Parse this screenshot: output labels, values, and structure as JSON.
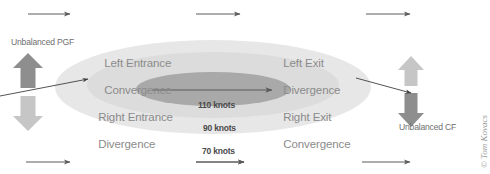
{
  "figure": {
    "credit": "© Tom Kovacs"
  },
  "quadrants": [
    {
      "id": "left-entrance",
      "line1": "Left Entrance",
      "line2": "Convergence"
    },
    {
      "id": "left-exit",
      "line1": "Left Exit",
      "line2": "Divergence"
    },
    {
      "id": "right-entrance",
      "line1": "Right Entrance",
      "line2": "Divergence"
    },
    {
      "id": "right-exit",
      "line1": "Right Exit",
      "line2": "Convergence"
    }
  ],
  "isotachs": [
    {
      "id": "core",
      "label": "110 knots"
    },
    {
      "id": "middle",
      "label": "90 knots"
    },
    {
      "id": "outer",
      "label": "70 knots"
    }
  ],
  "forces": [
    {
      "id": "pgf",
      "label": "Unbalanced PGF"
    },
    {
      "id": "cf",
      "label": "Unbalanced CF"
    }
  ],
  "colors": {
    "outer_isotach": "#e6e6e6",
    "middle_isotach": "#d4d4d4",
    "core_isotach": "#a8a8a8",
    "arrow_dark": "#8e8e8e",
    "arrow_light": "#c4c4c4",
    "flow_arrow": "#5a5a5a",
    "label_text": "#8b8b8b",
    "knots_text": "#4a4a4a"
  },
  "icons": {
    "up_arrow": "up-arrow-icon",
    "down_arrow": "down-arrow-icon",
    "flow_arrow": "right-flow-arrow-icon"
  }
}
